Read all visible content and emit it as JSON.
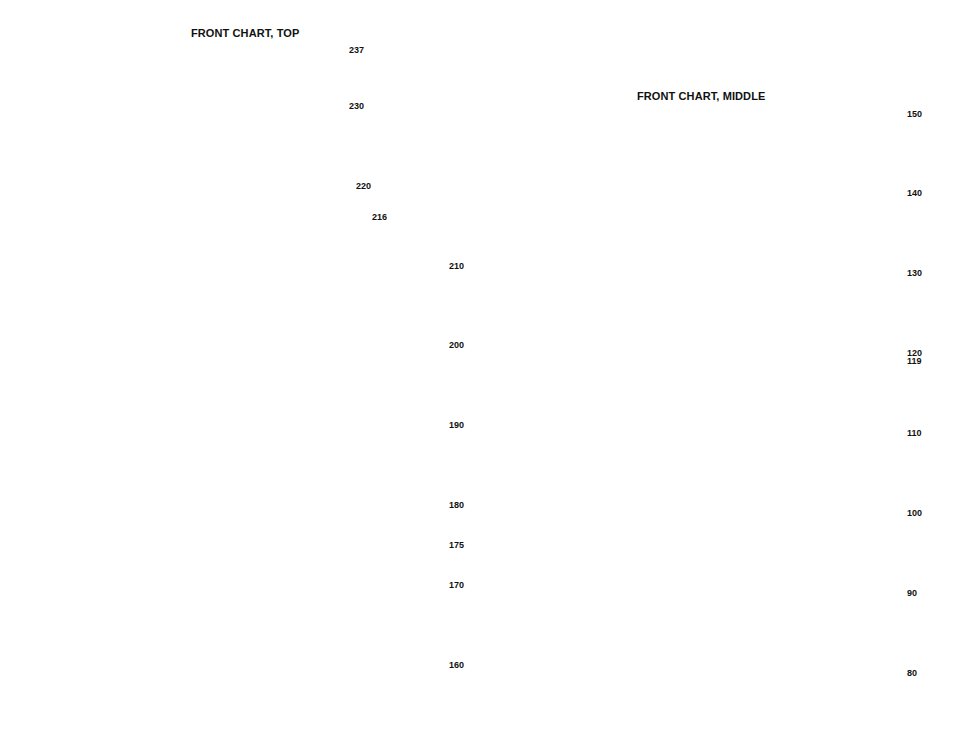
{
  "charts": [
    {
      "id": "top",
      "title": "FRONT CHART, TOP",
      "row_labels": [
        {
          "text": "237",
          "x": 349,
          "y": 45
        },
        {
          "text": "230",
          "x": 349,
          "y": 101
        },
        {
          "text": "220",
          "x": 356,
          "y": 181
        },
        {
          "text": "216",
          "x": 372,
          "y": 212
        },
        {
          "text": "210",
          "x": 449,
          "y": 261
        },
        {
          "text": "200",
          "x": 449,
          "y": 340
        },
        {
          "text": "190",
          "x": 449,
          "y": 420
        },
        {
          "text": "180",
          "x": 449,
          "y": 500
        },
        {
          "text": "175",
          "x": 449,
          "y": 540
        },
        {
          "text": "170",
          "x": 449,
          "y": 580
        },
        {
          "text": "160",
          "x": 449,
          "y": 660
        }
      ]
    },
    {
      "id": "middle",
      "title": "FRONT CHART, MIDDLE",
      "row_labels": [
        {
          "text": "150",
          "x": 907,
          "y": 109
        },
        {
          "text": "140",
          "x": 907,
          "y": 188
        },
        {
          "text": "130",
          "x": 907,
          "y": 268
        },
        {
          "text": "120",
          "x": 907,
          "y": 348
        },
        {
          "text": "119",
          "x": 907,
          "y": 356
        },
        {
          "text": "110",
          "x": 907,
          "y": 428
        },
        {
          "text": "100",
          "x": 907,
          "y": 508
        },
        {
          "text": "90",
          "x": 907,
          "y": 588
        },
        {
          "text": "80",
          "x": 907,
          "y": 668
        }
      ]
    }
  ],
  "palette": {
    "dark": "#5c5c5c",
    "mid": "#8a8a8a",
    "light": "#b4b4b4",
    "pale": "#cfcfcf",
    "grid_minor": "#a9a9a9",
    "grid_major": "#222222",
    "backstitch": "#9a9a9a",
    "bead": "#ffffff"
  }
}
